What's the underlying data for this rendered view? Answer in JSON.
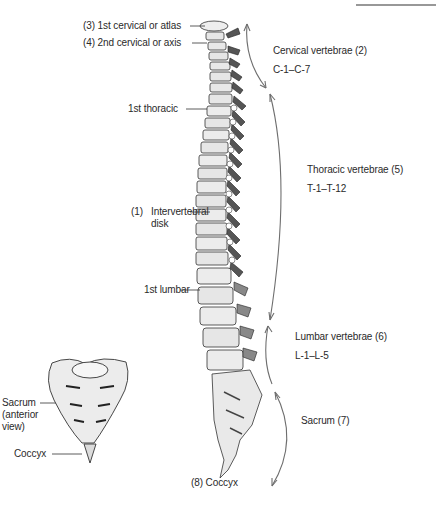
{
  "diagram": {
    "spine_labels_left": [
      {
        "id": "atlas",
        "text": "(3)   1st cervical or atlas"
      },
      {
        "id": "axis",
        "text": "(4)  2nd cervical or axis"
      },
      {
        "id": "first_thoracic",
        "text": "1st thoracic"
      },
      {
        "id": "intervertebral_num",
        "text": "(1)"
      },
      {
        "id": "intervertebral",
        "text": "Intervertebral"
      },
      {
        "id": "intervertebral_line2",
        "text": "disk"
      },
      {
        "id": "first_lumbar",
        "text": "1st lumbar"
      },
      {
        "id": "coccyx_main",
        "text": "(8)   Coccyx"
      }
    ],
    "region_labels_right": [
      {
        "id": "cervical",
        "title": "Cervical vertebrae   (2)",
        "range": "C-1–C-7"
      },
      {
        "id": "thoracic",
        "title": "Thoracic vertebrae   (5)",
        "range": "T-1–T-12"
      },
      {
        "id": "lumbar",
        "title": "Lumbar vertebrae   (6)",
        "range": "L-1–L-5"
      },
      {
        "id": "sacrum",
        "title": "Sacrum   (7)",
        "range": ""
      }
    ],
    "inset": {
      "sacrum_label_1": "Sacrum",
      "sacrum_label_2": "(anterior",
      "sacrum_label_3": "view)",
      "coccyx_label": "Coccyx"
    },
    "colors": {
      "ink": "#2a2a2a",
      "arrow": "#6e6e6e",
      "bone_fill": "#f2f2f2",
      "bone_shade": "#555555"
    }
  }
}
